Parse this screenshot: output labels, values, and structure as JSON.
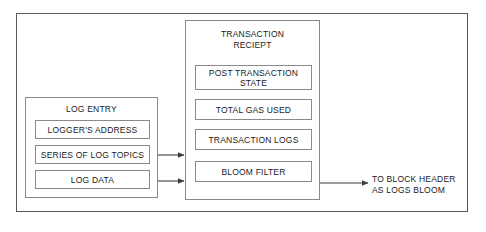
{
  "diagram": {
    "title_hidden": "",
    "outer_frame": {
      "name": "diagram-border"
    },
    "log_entry": {
      "title": "LOG ENTRY",
      "items": [
        {
          "label": "LOGGER'S ADDRESS"
        },
        {
          "label": "SERIES OF LOG TOPICS"
        },
        {
          "label": "LOG DATA"
        }
      ]
    },
    "transaction_receipt": {
      "title_line1": "TRANSACTION",
      "title_line2": "RECIEPT",
      "items": [
        {
          "label": "POST TRANSACTION STATE"
        },
        {
          "label": "TOTAL GAS USED"
        },
        {
          "label": "TRANSACTION LOGS"
        },
        {
          "label": "BLOOM FILTER"
        }
      ]
    },
    "outflow": {
      "line1": "TO BLOCK HEADER",
      "line2": "AS LOGS BLOOM"
    },
    "colors": {
      "frame": "#595959",
      "box_border": "#8a8a8a",
      "text": "#1a1a1a",
      "background": "#ffffff",
      "connector": "#3d3d3d"
    }
  }
}
